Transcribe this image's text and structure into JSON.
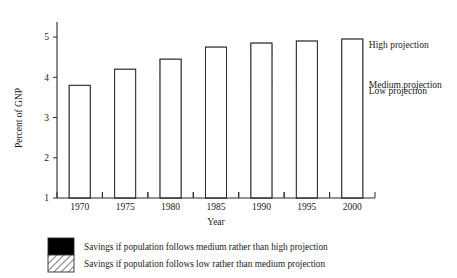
{
  "chart_data": {
    "type": "bar",
    "title": "",
    "xlabel": "Year",
    "ylabel": "Percent of GNP",
    "categories": [
      "1970",
      "1975",
      "1980",
      "1985",
      "1990",
      "1995",
      "2000"
    ],
    "ylim": [
      1,
      5.3
    ],
    "yticks": [
      "1",
      "2",
      "3",
      "4",
      "5"
    ],
    "ytick_values": [
      1,
      2,
      3,
      4,
      5
    ],
    "grid": false,
    "legend_position": "below-axis",
    "stacked": true,
    "series": [
      {
        "name": "Low projection",
        "key": "low",
        "style": "white",
        "values": [
          3.8,
          4.2,
          4.1,
          4.15,
          3.9,
          3.75,
          3.65
        ]
      },
      {
        "name": "Medium projection",
        "key": "medium",
        "style": "hatched",
        "values": [
          3.8,
          4.2,
          4.4,
          4.6,
          4.55,
          4.2,
          3.8
        ]
      },
      {
        "name": "High projection",
        "key": "high",
        "style": "black",
        "values": [
          3.8,
          4.2,
          4.45,
          4.75,
          4.85,
          4.9,
          4.95
        ]
      }
    ],
    "annotations": [
      {
        "text": "High projection",
        "series": "high"
      },
      {
        "text": "Medium projection",
        "series": "medium"
      },
      {
        "text": "Low projection",
        "series": "low"
      }
    ],
    "legend": [
      {
        "swatch": "black",
        "text": "Savings if population follows medium rather than high projection"
      },
      {
        "swatch": "hatched",
        "text": "Savings if population follows low rather than medium projection"
      }
    ]
  },
  "colors": {
    "black_segment": "#000000",
    "hatch_line": "#2b2b2b",
    "white_segment": "#ffffff",
    "axis": "#2b2b2b",
    "text": "#1a1a1a",
    "background": "#ffffff"
  },
  "axes": {
    "y_title": "Percent of GNP",
    "x_title": "Year"
  }
}
